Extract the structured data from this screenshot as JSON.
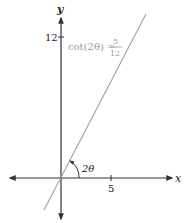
{
  "diagram": {
    "type": "coordinate-plane",
    "axes": {
      "x_label": "x",
      "y_label": "y",
      "x_tick": "5",
      "y_tick": "12"
    },
    "line": {
      "equation_lhs": "cot(2θ) =",
      "equation_num": "5",
      "equation_den": "12",
      "color": "#a0a0a0"
    },
    "angle_label": "2θ",
    "colors": {
      "axis": "#333333",
      "line": "#a0a0a0",
      "equation": "#9a9a9a"
    }
  }
}
